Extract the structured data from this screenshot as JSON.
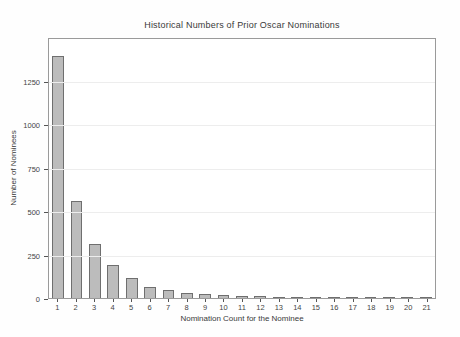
{
  "figure": {
    "background": "#fefefe",
    "plot_border_color": "#9a9a9a",
    "gridline_color": "#ededed",
    "text_color": "#3a3a3a"
  },
  "chart_data": {
    "type": "bar",
    "title": "Historical Numbers of Prior Oscar Nominations",
    "xlabel": "Nomination Count for the Nominee",
    "ylabel": "Number of Nominees",
    "categories": [
      "1",
      "2",
      "3",
      "4",
      "5",
      "6",
      "7",
      "8",
      "9",
      "10",
      "11",
      "12",
      "13",
      "14",
      "15",
      "16",
      "17",
      "18",
      "19",
      "20",
      "21"
    ],
    "values": [
      1390,
      560,
      308,
      188,
      115,
      66,
      48,
      28,
      22,
      17,
      14,
      11,
      8,
      7,
      4,
      3,
      2,
      2,
      1,
      1,
      1
    ],
    "yticks": [
      0,
      250,
      500,
      750,
      1000,
      1250
    ],
    "ylim": [
      0,
      1500
    ],
    "grid": "horizontal-major",
    "legend_position": "none",
    "bar_fill": "#bcbcbc",
    "bar_border": "#6f6f6f"
  }
}
